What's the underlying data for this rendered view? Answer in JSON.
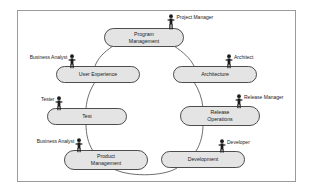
{
  "diagram": {
    "frame": {
      "stroke": "#9a9a9a",
      "fill": "#ffffff"
    },
    "style": {
      "node_fill": "#e4e4e4",
      "node_stroke": "#3a3a3a",
      "ring_stroke": "#4a4a4a",
      "actor_color": "#1c1c1c",
      "text_color": "#1a1a1a"
    },
    "nodes": [
      {
        "id": "program-management",
        "label_line1": "Program",
        "label_line2": "Management"
      },
      {
        "id": "user-experience",
        "label_line1": "User Experience",
        "label_line2": ""
      },
      {
        "id": "architecture",
        "label_line1": "Architecture",
        "label_line2": ""
      },
      {
        "id": "test",
        "label_line1": "Test",
        "label_line2": ""
      },
      {
        "id": "release-operations",
        "label_line1": "Release",
        "label_line2": "Operations"
      },
      {
        "id": "product-management",
        "label_line1": "Product",
        "label_line2": "Management"
      },
      {
        "id": "development",
        "label_line1": "Development",
        "label_line2": ""
      }
    ],
    "actors": [
      {
        "id": "project-manager",
        "label": "Project Manager",
        "side": "right",
        "attached_to": "program-management"
      },
      {
        "id": "business-analyst-ux",
        "label": "Business Analyst",
        "side": "left",
        "attached_to": "user-experience"
      },
      {
        "id": "architect",
        "label": "Architect",
        "side": "right",
        "attached_to": "architecture"
      },
      {
        "id": "tester",
        "label": "Tester",
        "side": "left",
        "attached_to": "test"
      },
      {
        "id": "release-manager",
        "label": "Release Manager",
        "side": "right",
        "attached_to": "release-operations"
      },
      {
        "id": "business-analyst-pm",
        "label": "Business Analyst",
        "side": "left",
        "attached_to": "product-management"
      },
      {
        "id": "developer",
        "label": "Developer",
        "side": "right",
        "attached_to": "development"
      }
    ]
  }
}
